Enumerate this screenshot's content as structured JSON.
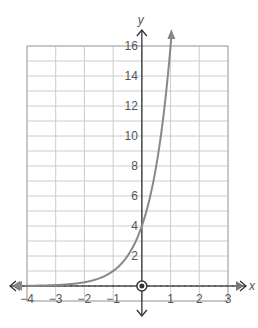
{
  "chart_data": {
    "type": "line",
    "title": "",
    "xlabel": "x",
    "ylabel": "y",
    "xlim": [
      -4,
      3
    ],
    "ylim": [
      -1,
      16
    ],
    "grid": true,
    "x_ticks": [
      -4,
      -3,
      -2,
      -1,
      1,
      2,
      3
    ],
    "x_tick_labels": [
      "−4",
      "−3",
      "−2",
      "−1",
      "1",
      "2",
      "3"
    ],
    "y_ticks": [
      2,
      4,
      6,
      8,
      10,
      12,
      14,
      16
    ],
    "y_tick_labels": [
      "2",
      "4",
      "6",
      "8",
      "10",
      "12",
      "14",
      "16"
    ],
    "series": [
      {
        "name": "y = 4·4^x",
        "function": "4*4^x",
        "x": [
          -4,
          -3,
          -2,
          -1,
          0,
          1
        ],
        "y": [
          0.016,
          0.0625,
          0.25,
          1,
          4,
          16
        ]
      }
    ],
    "asymptote": {
      "type": "horizontal",
      "y": 0,
      "style": "dashed"
    },
    "marked_points": [
      {
        "x": 0,
        "y": 0,
        "style": "circled"
      }
    ],
    "colors": {
      "curve": "#888888",
      "axis": "#333333",
      "grid": "#cccccc",
      "asymptote": "#777777"
    }
  }
}
